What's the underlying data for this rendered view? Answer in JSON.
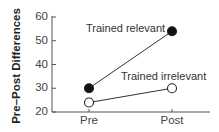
{
  "chart_data": {
    "type": "line",
    "title": "",
    "xlabel": "",
    "ylabel": "Pre–Post Differences",
    "categories": [
      "Pre",
      "Post"
    ],
    "ylim": [
      20,
      60
    ],
    "yticks": [
      20,
      30,
      40,
      50,
      60
    ],
    "grid": false,
    "legend": "inline labels",
    "series": [
      {
        "name": "Trained relevant",
        "marker": "filled-circle",
        "values": [
          30,
          54
        ]
      },
      {
        "name": "Trained irrelevant",
        "marker": "open-circle",
        "values": [
          24,
          30
        ]
      }
    ]
  },
  "labels": {
    "ylabel": "Pre–Post Differences",
    "yticks": [
      "60",
      "50",
      "40",
      "30",
      "20"
    ],
    "xticks": [
      "Pre",
      "Post"
    ],
    "series": [
      "Trained relevant",
      "Trained irrelevant"
    ]
  },
  "colors": {
    "axis": "#555555",
    "line": "#333333",
    "marker_fill": "#111111",
    "text": "#444444"
  }
}
